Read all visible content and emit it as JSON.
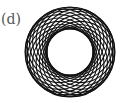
{
  "figure": {
    "label": "(d)",
    "type": "rosette of circles",
    "center": [
      70,
      52
    ],
    "circle_radius": 34,
    "offset": 11,
    "circle_count": 20,
    "stroke_color": "#111111"
  }
}
